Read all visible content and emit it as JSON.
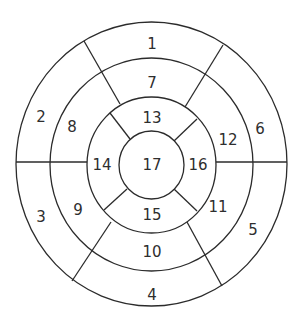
{
  "diagram": {
    "stroke_color": "#2b2b2b",
    "text_color": "#2e2e2e",
    "segments": [
      {
        "id": 1,
        "label": "1",
        "x": 152,
        "y": 44
      },
      {
        "id": 2,
        "label": "2",
        "x": 41,
        "y": 117
      },
      {
        "id": 3,
        "label": "3",
        "x": 41,
        "y": 217
      },
      {
        "id": 4,
        "label": "4",
        "x": 152,
        "y": 295
      },
      {
        "id": 5,
        "label": "5",
        "x": 253,
        "y": 230
      },
      {
        "id": 6,
        "label": "6",
        "x": 260,
        "y": 129
      },
      {
        "id": 7,
        "label": "7",
        "x": 152,
        "y": 83
      },
      {
        "id": 8,
        "label": "8",
        "x": 72,
        "y": 127
      },
      {
        "id": 9,
        "label": "9",
        "x": 78,
        "y": 210
      },
      {
        "id": 10,
        "label": "10",
        "x": 152,
        "y": 252
      },
      {
        "id": 11,
        "label": "11",
        "x": 218,
        "y": 207
      },
      {
        "id": 12,
        "label": "12",
        "x": 228,
        "y": 140
      },
      {
        "id": 13,
        "label": "13",
        "x": 152,
        "y": 118
      },
      {
        "id": 14,
        "label": "14",
        "x": 102,
        "y": 165
      },
      {
        "id": 15,
        "label": "15",
        "x": 152,
        "y": 215
      },
      {
        "id": 16,
        "label": "16",
        "x": 198,
        "y": 165
      },
      {
        "id": 17,
        "label": "17",
        "x": 152,
        "y": 165
      }
    ]
  }
}
